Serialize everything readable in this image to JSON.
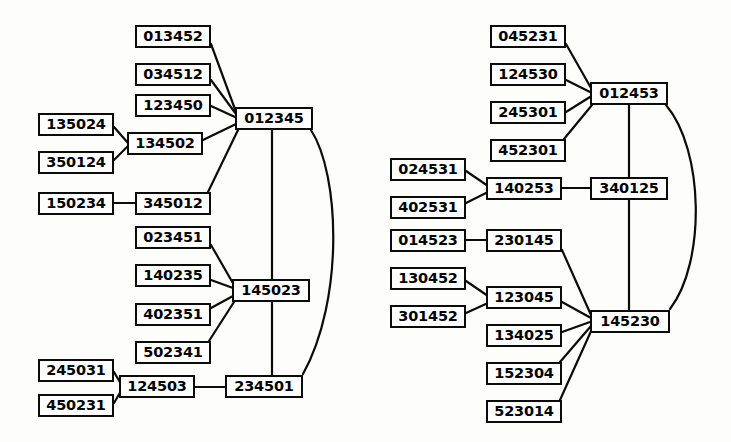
{
  "diagram": {
    "background_color": "#fdfdfc",
    "node_fill_color": "#ffffff",
    "line_color": "#0b0b0b",
    "panels": [
      {
        "name": "left-panel",
        "nodes": [
          {
            "id": "L1",
            "label": "013452",
            "x": 135,
            "y": 25,
            "w": 76,
            "h": 23
          },
          {
            "id": "L2",
            "label": "034512",
            "x": 135,
            "y": 63,
            "w": 76,
            "h": 23
          },
          {
            "id": "L3",
            "label": "123450",
            "x": 135,
            "y": 94,
            "w": 76,
            "h": 23
          },
          {
            "id": "L4",
            "label": "135024",
            "x": 38,
            "y": 113,
            "w": 76,
            "h": 23
          },
          {
            "id": "L5",
            "label": "134502",
            "x": 127,
            "y": 132,
            "w": 76,
            "h": 23
          },
          {
            "id": "L6",
            "label": "350124",
            "x": 38,
            "y": 151,
            "w": 76,
            "h": 23
          },
          {
            "id": "L7",
            "label": "150234",
            "x": 38,
            "y": 192,
            "w": 76,
            "h": 23
          },
          {
            "id": "L8",
            "label": "345012",
            "x": 135,
            "y": 192,
            "w": 76,
            "h": 23
          },
          {
            "id": "L9",
            "label": "012345",
            "x": 235,
            "y": 107,
            "w": 78,
            "h": 23
          },
          {
            "id": "L10",
            "label": "023451",
            "x": 135,
            "y": 226,
            "w": 76,
            "h": 23
          },
          {
            "id": "L11",
            "label": "140235",
            "x": 135,
            "y": 264,
            "w": 76,
            "h": 23
          },
          {
            "id": "L12",
            "label": "145023",
            "x": 232,
            "y": 279,
            "w": 78,
            "h": 23
          },
          {
            "id": "L13",
            "label": "402351",
            "x": 135,
            "y": 303,
            "w": 76,
            "h": 23
          },
          {
            "id": "L14",
            "label": "502341",
            "x": 135,
            "y": 341,
            "w": 76,
            "h": 23
          },
          {
            "id": "L15",
            "label": "245031",
            "x": 38,
            "y": 359,
            "w": 76,
            "h": 23
          },
          {
            "id": "L16",
            "label": "124503",
            "x": 119,
            "y": 375,
            "w": 76,
            "h": 23
          },
          {
            "id": "L17",
            "label": "450231",
            "x": 38,
            "y": 394,
            "w": 76,
            "h": 23
          },
          {
            "id": "L18",
            "label": "234501",
            "x": 225,
            "y": 375,
            "w": 78,
            "h": 23
          }
        ],
        "edges": [
          {
            "from": "013452",
            "to": "012345",
            "kind": "straight"
          },
          {
            "from": "034512",
            "to": "012345",
            "kind": "straight"
          },
          {
            "from": "123450",
            "to": "012345",
            "kind": "straight"
          },
          {
            "from": "134502",
            "to": "012345",
            "kind": "straight"
          },
          {
            "from": "345012",
            "to": "012345",
            "kind": "straight"
          },
          {
            "from": "135024",
            "to": "134502",
            "kind": "straight"
          },
          {
            "from": "350124",
            "to": "134502",
            "kind": "straight"
          },
          {
            "from": "150234",
            "to": "345012",
            "kind": "straight"
          },
          {
            "from": "012345",
            "to": "145023",
            "kind": "straight"
          },
          {
            "from": "012345",
            "to": "234501",
            "kind": "curve"
          },
          {
            "from": "023451",
            "to": "145023",
            "kind": "straight"
          },
          {
            "from": "140235",
            "to": "145023",
            "kind": "straight"
          },
          {
            "from": "402351",
            "to": "145023",
            "kind": "straight"
          },
          {
            "from": "502341",
            "to": "145023",
            "kind": "straight"
          },
          {
            "from": "145023",
            "to": "234501",
            "kind": "straight"
          },
          {
            "from": "245031",
            "to": "124503",
            "kind": "straight"
          },
          {
            "from": "450231",
            "to": "124503",
            "kind": "straight"
          },
          {
            "from": "124503",
            "to": "234501",
            "kind": "straight"
          }
        ]
      },
      {
        "name": "right-panel",
        "nodes": [
          {
            "id": "R1",
            "label": "045231",
            "x": 490,
            "y": 25,
            "w": 76,
            "h": 23
          },
          {
            "id": "R2",
            "label": "124530",
            "x": 490,
            "y": 63,
            "w": 76,
            "h": 23
          },
          {
            "id": "R3",
            "label": "012453",
            "x": 590,
            "y": 82,
            "w": 78,
            "h": 23
          },
          {
            "id": "R4",
            "label": "245301",
            "x": 490,
            "y": 101,
            "w": 76,
            "h": 23
          },
          {
            "id": "R5",
            "label": "452301",
            "x": 490,
            "y": 139,
            "w": 76,
            "h": 23
          },
          {
            "id": "R6",
            "label": "024531",
            "x": 390,
            "y": 158,
            "w": 76,
            "h": 23
          },
          {
            "id": "R7",
            "label": "140253",
            "x": 486,
            "y": 177,
            "w": 76,
            "h": 23
          },
          {
            "id": "R8",
            "label": "340125",
            "x": 590,
            "y": 177,
            "w": 78,
            "h": 23
          },
          {
            "id": "R9",
            "label": "402531",
            "x": 390,
            "y": 196,
            "w": 76,
            "h": 23
          },
          {
            "id": "R10",
            "label": "014523",
            "x": 390,
            "y": 229,
            "w": 76,
            "h": 23
          },
          {
            "id": "R11",
            "label": "230145",
            "x": 486,
            "y": 229,
            "w": 76,
            "h": 23
          },
          {
            "id": "R12",
            "label": "130452",
            "x": 390,
            "y": 267,
            "w": 76,
            "h": 23
          },
          {
            "id": "R13",
            "label": "123045",
            "x": 486,
            "y": 286,
            "w": 76,
            "h": 23
          },
          {
            "id": "R14",
            "label": "145230",
            "x": 590,
            "y": 310,
            "w": 80,
            "h": 23
          },
          {
            "id": "R15",
            "label": "301452",
            "x": 390,
            "y": 305,
            "w": 76,
            "h": 23
          },
          {
            "id": "R16",
            "label": "134025",
            "x": 486,
            "y": 324,
            "w": 76,
            "h": 23
          },
          {
            "id": "R17",
            "label": "152304",
            "x": 486,
            "y": 362,
            "w": 76,
            "h": 23
          },
          {
            "id": "R18",
            "label": "523014",
            "x": 486,
            "y": 400,
            "w": 76,
            "h": 23
          }
        ],
        "edges": [
          {
            "from": "045231",
            "to": "012453",
            "kind": "straight"
          },
          {
            "from": "124530",
            "to": "012453",
            "kind": "straight"
          },
          {
            "from": "245301",
            "to": "012453",
            "kind": "straight"
          },
          {
            "from": "452301",
            "to": "012453",
            "kind": "straight"
          },
          {
            "from": "024531",
            "to": "140253",
            "kind": "straight"
          },
          {
            "from": "402531",
            "to": "140253",
            "kind": "straight"
          },
          {
            "from": "140253",
            "to": "340125",
            "kind": "straight"
          },
          {
            "from": "012453",
            "to": "340125",
            "kind": "straight"
          },
          {
            "from": "012453",
            "to": "145230",
            "kind": "curve"
          },
          {
            "from": "340125",
            "to": "145230",
            "kind": "straight"
          },
          {
            "from": "014523",
            "to": "230145",
            "kind": "straight"
          },
          {
            "from": "230145",
            "to": "145230",
            "kind": "straight"
          },
          {
            "from": "130452",
            "to": "123045",
            "kind": "straight"
          },
          {
            "from": "301452",
            "to": "123045",
            "kind": "straight"
          },
          {
            "from": "123045",
            "to": "145230",
            "kind": "straight"
          },
          {
            "from": "134025",
            "to": "145230",
            "kind": "straight"
          },
          {
            "from": "152304",
            "to": "145230",
            "kind": "straight"
          },
          {
            "from": "523014",
            "to": "145230",
            "kind": "straight"
          }
        ]
      }
    ]
  }
}
